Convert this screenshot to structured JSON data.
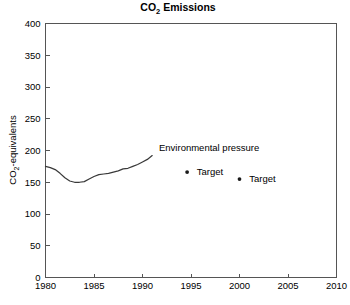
{
  "chart_data": {
    "type": "line",
    "title": "CO2 Emissions",
    "title_main": "CO",
    "title_sub": "2",
    "title_tail": " Emissions",
    "xlabel": "",
    "ylabel": "CO2-equivalents",
    "ylabel_main": "CO",
    "ylabel_sub": "2",
    "ylabel_tail": "-equivalents",
    "xlim": [
      1980,
      2010
    ],
    "ylim": [
      0,
      400
    ],
    "xticks": [
      1980,
      1985,
      1990,
      1995,
      2000,
      2005,
      2010
    ],
    "yticks": [
      0,
      50,
      100,
      150,
      200,
      250,
      300,
      350,
      400
    ],
    "xtick_labels": [
      "1980",
      "1985",
      "1990",
      "1995",
      "2000",
      "2005",
      "2010"
    ],
    "ytick_labels": [
      "0",
      "50",
      "100",
      "150",
      "200",
      "250",
      "300",
      "350",
      "400"
    ],
    "grid": false,
    "legend": "none",
    "series": [
      {
        "name": "Environmental pressure",
        "type": "line",
        "color": "#3a3a3a",
        "x": [
          1980,
          1980.5,
          1981,
          1981.5,
          1982,
          1982.5,
          1983,
          1983.5,
          1984,
          1984.5,
          1985,
          1985.5,
          1986,
          1986.5,
          1987,
          1987.5,
          1988,
          1988.5,
          1989,
          1989.5,
          1990,
          1990.5,
          1991
        ],
        "values": [
          175,
          173,
          170,
          164,
          157,
          152,
          150,
          150,
          151,
          155,
          159,
          162,
          163,
          164,
          166,
          168,
          171,
          172,
          175,
          178,
          182,
          186,
          192
        ]
      },
      {
        "name": "Target",
        "type": "scatter",
        "color": "#1a1a1a",
        "points": [
          {
            "x": 1994.6,
            "y": 166,
            "label": "Target"
          },
          {
            "x": 2000.0,
            "y": 155,
            "label": "Target"
          }
        ]
      }
    ],
    "annotations": [
      {
        "name": "environmental-pressure-label",
        "text": "Environmental pressure",
        "x": 1991.7,
        "y": 205
      },
      {
        "name": "target-label-1",
        "text": "Target",
        "x": 1995.6,
        "y": 166
      },
      {
        "name": "target-label-2",
        "text": "Target",
        "x": 2001.0,
        "y": 155
      }
    ]
  }
}
